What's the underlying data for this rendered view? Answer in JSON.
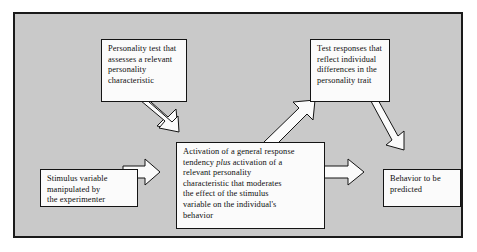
{
  "diagram": {
    "background_color": "#c9c9c9",
    "frame_border_color": "#1a1a1a",
    "node_fill_color": "#fbfbfb",
    "node_border_color": "#141414",
    "nodes": [
      {
        "id": "personality-test",
        "text": "Personality test that\nassesses a relevant\npersonality\ncharacteristic"
      },
      {
        "id": "test-responses",
        "text": "Test responses that\nreflect individual\ndifferences in the\npersonality trait"
      },
      {
        "id": "stimulus",
        "text": "Stimulus variable\nmanipulated by\nthe experimenter"
      },
      {
        "id": "activation",
        "text_part_1": "Activation of a general response\ntendency ",
        "text_emphasis": "plus",
        "text_part_2": " activation of a\nrelevant personality\ncharacteristic that moderates\nthe effect of the stimulus\nvariable on the individual's\nbehavior"
      },
      {
        "id": "behavior",
        "text": "Behavior to be\npredicted"
      }
    ],
    "arrows": [
      {
        "id": "personality-test-to-activation",
        "from": "personality-test",
        "to": "activation",
        "direction": "down-right"
      },
      {
        "id": "stimulus-to-activation",
        "from": "stimulus",
        "to": "activation",
        "direction": "right"
      },
      {
        "id": "activation-to-test-responses",
        "from": "activation",
        "to": "test-responses",
        "direction": "up-right"
      },
      {
        "id": "test-responses-to-behavior",
        "from": "test-responses",
        "to": "behavior",
        "direction": "down-right"
      },
      {
        "id": "activation-to-behavior",
        "from": "activation",
        "to": "behavior",
        "direction": "right"
      }
    ]
  }
}
